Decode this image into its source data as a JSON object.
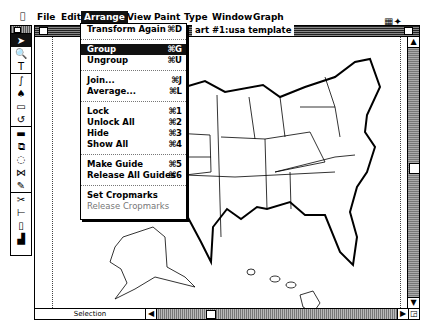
{
  "menubar": {
    "apple_icon": "apple-icon",
    "items": [
      "File",
      "Edit",
      "Arrange",
      "View",
      "Paint",
      "Type",
      "Window",
      "Graph"
    ],
    "active": "Arrange",
    "right_icons": [
      "clipboard-icon",
      "app-icon"
    ]
  },
  "tools": [
    {
      "icon": "arrow-icon",
      "glyph": "➤",
      "selected": true
    },
    {
      "icon": "zoom-icon",
      "glyph": "🔍"
    },
    {
      "icon": "text-icon",
      "glyph": "T"
    },
    {
      "icon": "freehand-icon",
      "glyph": "∫"
    },
    {
      "icon": "pen-icon",
      "glyph": "♠"
    },
    {
      "icon": "rectangle-icon",
      "glyph": "▭"
    },
    {
      "icon": "rotate-icon",
      "glyph": "↺"
    },
    {
      "icon": "blend-icon",
      "glyph": "▬"
    },
    {
      "icon": "reflect-icon",
      "glyph": "⧉"
    },
    {
      "icon": "scale-icon",
      "glyph": "◌"
    },
    {
      "icon": "shear-icon",
      "glyph": "⋈"
    },
    {
      "icon": "paint-icon",
      "glyph": "✎"
    },
    {
      "icon": "scissors-icon",
      "glyph": "✂"
    },
    {
      "icon": "measure-icon",
      "glyph": "⊢"
    },
    {
      "icon": "page-icon",
      "glyph": "▯"
    },
    {
      "icon": "graph-icon",
      "glyph": "▟"
    }
  ],
  "window": {
    "title": "art #1:usa template",
    "status_label": "Selection"
  },
  "arrange_menu": {
    "items": [
      {
        "label": "Transform Again",
        "shortcut": "⌘D"
      },
      {
        "sep": true
      },
      {
        "label": "Group",
        "shortcut": "⌘G",
        "highlighted": true
      },
      {
        "label": "Ungroup",
        "shortcut": "⌘U"
      },
      {
        "sep": true
      },
      {
        "label": "Join...",
        "shortcut": "⌘J"
      },
      {
        "label": "Average...",
        "shortcut": "⌘L"
      },
      {
        "sep": true
      },
      {
        "label": "Lock",
        "shortcut": "⌘1"
      },
      {
        "label": "Unlock All",
        "shortcut": "⌘2"
      },
      {
        "label": "Hide",
        "shortcut": "⌘3"
      },
      {
        "label": "Show All",
        "shortcut": "⌘4"
      },
      {
        "sep": true
      },
      {
        "label": "Make Guide",
        "shortcut": "⌘5"
      },
      {
        "label": "Release All Guides",
        "shortcut": "⌘6"
      },
      {
        "sep": true
      },
      {
        "label": "Set Cropmarks",
        "shortcut": ""
      },
      {
        "label": "Release Cropmarks",
        "shortcut": "",
        "disabled": true
      }
    ]
  },
  "map": {
    "subject": "USA states template",
    "scroll_arrows": {
      "up": "▲",
      "down": "▼",
      "left": "◀",
      "right": "▶",
      "grow": "◲"
    }
  }
}
